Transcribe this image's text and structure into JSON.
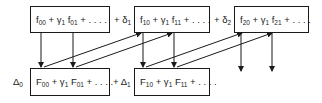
{
  "diagram": {
    "top_row": [
      {
        "id": "f0",
        "term1": "f",
        "sub1": "00",
        "op": "+ γ",
        "op_sub": "1",
        "term2": "f",
        "sub2": "01",
        "tail": "+ . . . ."
      },
      {
        "id": "f1",
        "term1": "f",
        "sub1": "10",
        "op": "+ γ",
        "op_sub": "1",
        "term2": "f",
        "sub2": "11",
        "tail": "+ . . . ."
      },
      {
        "id": "f2",
        "term1": "f",
        "sub1": "20",
        "op": "+ γ",
        "op_sub": "1",
        "term2": "f",
        "sub2": "21",
        "tail": "+ . . . ."
      }
    ],
    "top_connectors": [
      {
        "text": "+ δ",
        "sub": "1"
      },
      {
        "text": "+ δ",
        "sub": "2"
      }
    ],
    "bottom_row": [
      {
        "id": "F0",
        "term1": "F",
        "sub1": "00",
        "op": "+ γ",
        "op_sub": "1",
        "term2": "F",
        "sub2": "01",
        "tail": "+ . . . ."
      },
      {
        "id": "F1",
        "term1": "F",
        "sub1": "10",
        "op": "+ γ",
        "op_sub": "1",
        "term2": "F",
        "sub2": "11",
        "tail": "+ . . . ."
      }
    ],
    "bottom_prefix": {
      "text": "Δ",
      "sub": "0"
    },
    "bottom_connectors": [
      {
        "text": "+ Δ",
        "sub": "1"
      }
    ],
    "stroke_color": "#1a1a1a"
  }
}
